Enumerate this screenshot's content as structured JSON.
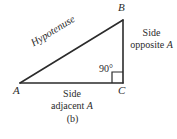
{
  "figure": {
    "caption": "(b)",
    "vertices": {
      "a": "A",
      "b": "B",
      "c": "C"
    },
    "angle_label": "90°",
    "hypotenuse_label": "Hypotenuse",
    "side_opposite": {
      "line1": "Side",
      "line2": "opposite",
      "variable": "A"
    },
    "side_adjacent": {
      "line1": "Side",
      "line2": "adjacent",
      "variable": "A"
    },
    "colors": {
      "stroke": "#2b2b2b",
      "background": "#ffffff",
      "text": "#2b2b2b"
    }
  }
}
